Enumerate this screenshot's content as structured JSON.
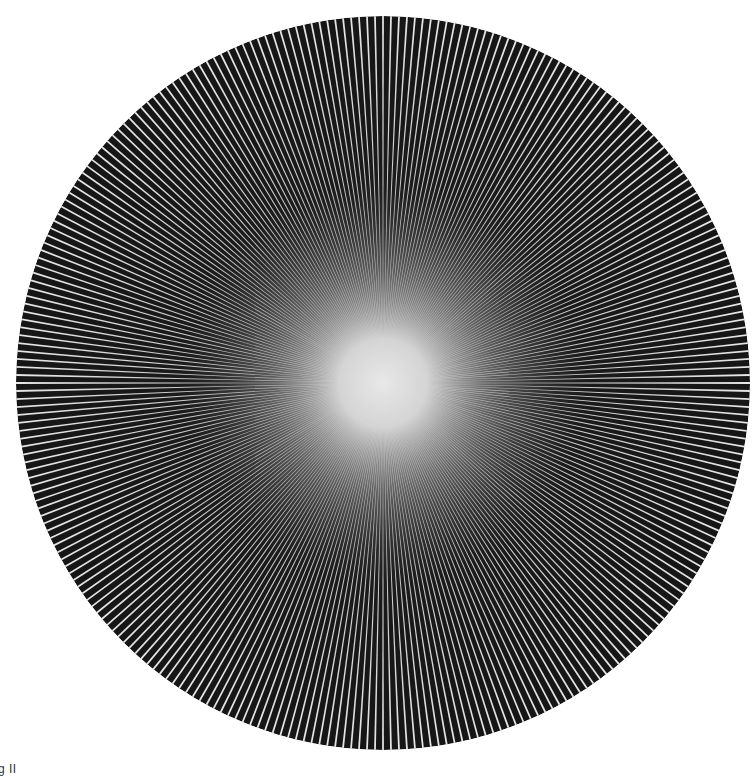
{
  "artwork": {
    "center_x": 383,
    "center_y": 383,
    "radius": 367,
    "ray_count": 288,
    "background_color": "#161616",
    "ray_color": "#e6e6e6",
    "glow_color": "#e4e4e4"
  },
  "caption": {
    "text": "g II"
  }
}
